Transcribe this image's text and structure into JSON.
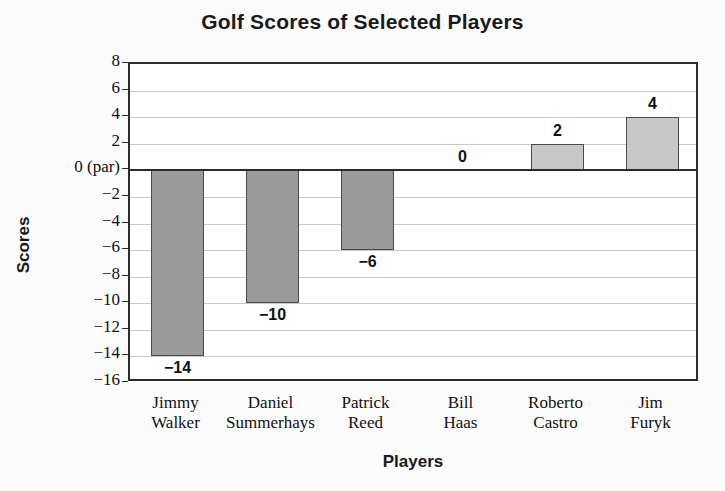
{
  "chart_data": {
    "type": "bar",
    "title": "Golf Scores of Selected Players",
    "xlabel": "Players",
    "ylabel": "Scores",
    "categories": [
      "Jimmy Walker",
      "Daniel Summerhays",
      "Patrick Reed",
      "Bill Haas",
      "Roberto Castro",
      "Jim Furyk"
    ],
    "category_lines": [
      [
        "Jimmy",
        "Walker"
      ],
      [
        "Daniel",
        "Summerhays"
      ],
      [
        "Patrick",
        "Reed"
      ],
      [
        "Bill",
        "Haas"
      ],
      [
        "Roberto",
        "Castro"
      ],
      [
        "Jim",
        "Furyk"
      ]
    ],
    "values": [
      -14,
      -10,
      -6,
      0,
      2,
      4
    ],
    "data_labels": [
      "−14",
      "−10",
      "−6",
      "0",
      "2",
      "4"
    ],
    "ylim": [
      -16,
      8
    ],
    "ytick_values": [
      8,
      6,
      4,
      2,
      0,
      -2,
      -4,
      -6,
      -8,
      -10,
      -12,
      -14,
      -16
    ],
    "ytick_labels": [
      "8",
      "6",
      "4",
      "2",
      "0 (par)",
      "−2",
      "−4",
      "−6",
      "−8",
      "−10",
      "−12",
      "−14",
      "−16"
    ],
    "grid": true,
    "legend": false,
    "colors": {
      "bar_negative": "#9a9a9a",
      "bar_positive": "#c8c8c8",
      "bar_border": "#4a4a4a",
      "gridline": "#c9c9c9",
      "axis": "#2b2b2b",
      "text": "#111111",
      "background": "#fbfbfb",
      "plot_background": "#ffffff"
    }
  }
}
